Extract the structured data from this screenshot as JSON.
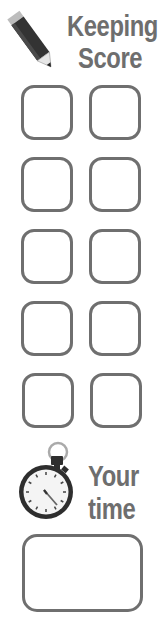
{
  "header": {
    "icon": "pencil-icon",
    "title_line1": "Keeping",
    "title_line2": "Score"
  },
  "score_boxes": {
    "rows": 5,
    "columns": 2,
    "values": [
      [
        "",
        ""
      ],
      [
        "",
        ""
      ],
      [
        "",
        ""
      ],
      [
        "",
        ""
      ],
      [
        "",
        ""
      ]
    ]
  },
  "time_section": {
    "icon": "stopwatch-icon",
    "label_line1": "Your",
    "label_line2": "time",
    "value": ""
  },
  "colors": {
    "text": "#6e6e6e",
    "box_border": "#6f6f6f",
    "icon_dark": "#2e2e2e"
  }
}
